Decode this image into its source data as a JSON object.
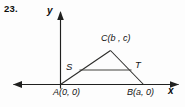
{
  "figure": {
    "problem_number": "23.",
    "axes": {
      "y_axis_label": "y",
      "x_axis_label": "x"
    },
    "points": {
      "A": {
        "name": "A",
        "coords": "(0, 0)",
        "label": "A(0, 0)"
      },
      "B": {
        "name": "B",
        "coords": "(a, 0)",
        "label": "B(a, 0)"
      },
      "C": {
        "name": "C",
        "coords": "(b , c)",
        "label": "C(b , c)"
      },
      "S": {
        "name": "S",
        "label": "S"
      },
      "T": {
        "name": "T",
        "label": "T"
      }
    },
    "colors": {
      "ink": "#141414",
      "background": "#fdfdfd"
    }
  }
}
